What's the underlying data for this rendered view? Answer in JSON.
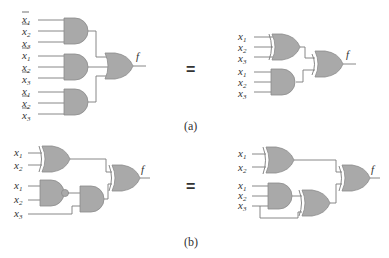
{
  "equals_sign": "=",
  "output_label": "f",
  "captions": {
    "a": "(a)",
    "b": "(b)"
  },
  "input_base": "x",
  "panel_a": {
    "left": {
      "and_gates": [
        {
          "inputs": [
            {
              "n": "1",
              "neg": true
            },
            {
              "n": "2",
              "neg": true
            },
            {
              "n": "3",
              "neg": false
            }
          ]
        },
        {
          "inputs": [
            {
              "n": "1",
              "neg": true
            },
            {
              "n": "2",
              "neg": false
            },
            {
              "n": "3",
              "neg": true
            }
          ]
        },
        {
          "inputs": [
            {
              "n": "1",
              "neg": false
            },
            {
              "n": "2",
              "neg": true
            },
            {
              "n": "3",
              "neg": true
            }
          ]
        }
      ],
      "output_gate": "OR"
    },
    "right": {
      "gates": [
        "XOR(x1,x2,x3)",
        "AND(x1,x2,x3)"
      ],
      "output_gate": "XOR"
    }
  },
  "panel_b": {
    "left": {
      "gates": [
        "XOR(x1,x2)",
        "NAND(x1,x2)",
        "AND(nand,x3)"
      ],
      "output_gate": "XOR"
    },
    "right": {
      "gates": [
        "XOR(x1,x2)",
        "AND(x1,x2,x3)",
        "XOR(and,x3)"
      ],
      "output_gate": "XOR"
    }
  },
  "colors": {
    "gate_fill": "#a9a9a9",
    "wire": "#7a7a7a",
    "text": "#333333"
  }
}
